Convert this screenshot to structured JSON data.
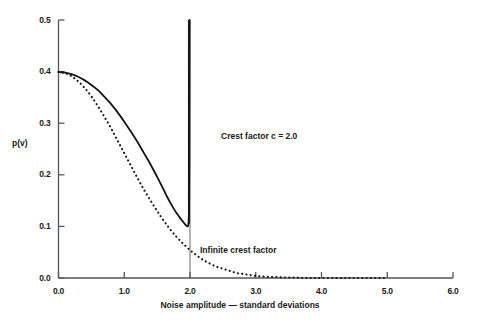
{
  "chart_data": {
    "type": "line",
    "title": "",
    "xlabel": "Noise amplitude — standard deviations",
    "ylabel": "p(v)",
    "xlim": [
      0.0,
      6.0
    ],
    "ylim": [
      0.0,
      0.5
    ],
    "grid": false,
    "legend_position": "inline-annotations",
    "xticks": [
      "0.0",
      "1.0",
      "2.0",
      "3.0",
      "4.0",
      "5.0",
      "6.0"
    ],
    "xtick_values": [
      0.0,
      1.0,
      2.0,
      3.0,
      4.0,
      5.0,
      6.0
    ],
    "yticks": [
      "0.0",
      "0.1",
      "0.2",
      "0.3",
      "0.4",
      "0.5"
    ],
    "ytick_values": [
      0.0,
      0.1,
      0.2,
      0.3,
      0.4,
      0.5
    ],
    "annotations": [
      {
        "name": "crest-factor-annotation",
        "text": "Crest factor c = 2.0",
        "x": 2.65,
        "y": 0.28
      },
      {
        "name": "infinite-crest-annotation",
        "text": "Infinite crest factor",
        "x": 2.35,
        "y": 0.065
      }
    ],
    "series": [
      {
        "name": "Crest factor c = 2.0",
        "style": "solid",
        "color": "#141414",
        "x": [
          0.0,
          0.1,
          0.2,
          0.3,
          0.4,
          0.5,
          0.6,
          0.7,
          0.8,
          0.9,
          1.0,
          1.1,
          1.2,
          1.3,
          1.4,
          1.5,
          1.6,
          1.65,
          1.7,
          1.75,
          1.8,
          1.84,
          1.87,
          1.9,
          1.92,
          1.94,
          1.95,
          1.96,
          1.965,
          1.97,
          1.975,
          1.98,
          1.983,
          1.986,
          1.988,
          1.99,
          1.992,
          1.993,
          1.994,
          1.995
        ],
        "y": [
          0.399,
          0.398,
          0.395,
          0.39,
          0.383,
          0.374,
          0.364,
          0.351,
          0.337,
          0.321,
          0.303,
          0.284,
          0.264,
          0.242,
          0.22,
          0.196,
          0.171,
          0.158,
          0.146,
          0.135,
          0.125,
          0.118,
          0.113,
          0.108,
          0.105,
          0.102,
          0.101,
          0.1,
          0.1,
          0.101,
          0.104,
          0.112,
          0.122,
          0.142,
          0.165,
          0.205,
          0.28,
          0.34,
          0.42,
          0.5
        ]
      },
      {
        "name": "Infinite crest factor",
        "style": "dotted",
        "color": "#141414",
        "x": [
          0.0,
          0.1,
          0.2,
          0.3,
          0.4,
          0.5,
          0.6,
          0.7,
          0.8,
          0.9,
          1.0,
          1.1,
          1.2,
          1.3,
          1.4,
          1.5,
          1.6,
          1.7,
          1.8,
          1.9,
          2.0,
          2.1,
          2.2,
          2.3,
          2.4,
          2.5,
          2.6,
          2.7,
          2.8,
          2.9,
          3.0,
          3.1,
          3.2,
          3.3,
          3.4,
          3.5,
          3.6,
          3.7,
          3.8,
          3.9,
          4.0,
          4.2,
          4.4,
          4.6,
          4.8,
          5.0
        ],
        "y": [
          0.399,
          0.397,
          0.391,
          0.381,
          0.368,
          0.352,
          0.333,
          0.312,
          0.29,
          0.266,
          0.242,
          0.218,
          0.194,
          0.171,
          0.15,
          0.13,
          0.111,
          0.094,
          0.079,
          0.066,
          0.054,
          0.044,
          0.035,
          0.028,
          0.022,
          0.018,
          0.014,
          0.01,
          0.008,
          0.006,
          0.004,
          0.003,
          0.002,
          0.002,
          0.001,
          0.001,
          0.001,
          0.0,
          0.0,
          0.0,
          0.0,
          0.0,
          0.0,
          0.0,
          0.0,
          0.0
        ]
      }
    ],
    "vertical_asymptote": {
      "name": "crest-factor-asymptote",
      "x": 2.0,
      "y_from": 0.0,
      "y_to": 0.5
    }
  },
  "axes": {
    "y_title": "p(v)",
    "x_title": "Noise amplitude — standard deviations",
    "x_tick_labels": [
      "0.0",
      "1.0",
      "2.0",
      "3.0",
      "4.0",
      "5.0",
      "6.0"
    ],
    "y_tick_labels": [
      "0.5",
      "0.4",
      "0.3",
      "0.2",
      "0.1",
      "0.0"
    ],
    "axis_color": "#555555"
  },
  "annotations": {
    "crest_factor": "Crest factor c = 2.0",
    "infinite_crest": "Infinite crest factor"
  },
  "colors": {
    "background": "#ffffff",
    "curve": "#141414",
    "axis": "#555555",
    "text": "#1a1a1a"
  }
}
